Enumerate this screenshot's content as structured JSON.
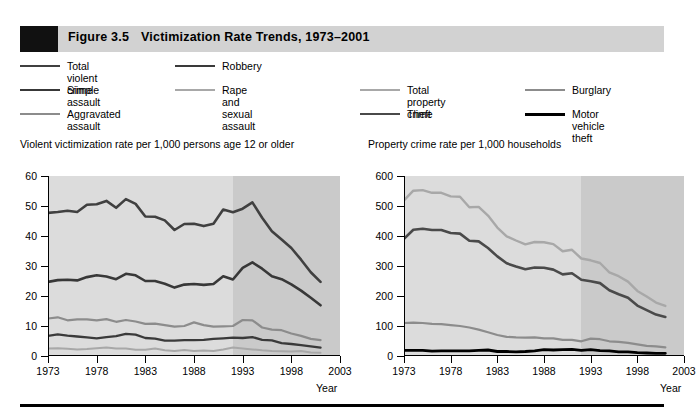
{
  "figure": {
    "number": "Figure 3.5",
    "title": "Victimization Rate Trends, 1973–2001"
  },
  "colors": {
    "total_violent_crime": "#404040",
    "robbery": "#3a3a3a",
    "simple_assault": "#383838",
    "rape_and_sexual_assault": "#a8a8a8",
    "aggravated_assault": "#8c8c8c",
    "total_property_crime": "#a8a8a8",
    "burglary": "#8c8c8c",
    "theft": "#4a4a4a",
    "motor_vehicle_theft": "#000000",
    "plot_background": "#dcdcdc",
    "shaded_region": "#cacaca",
    "title_bar": "#d2d2d2",
    "title_square": "#111111"
  },
  "legend": {
    "items": [
      {
        "label": "Total violent crime",
        "key": "total_violent_crime"
      },
      {
        "label": "Robbery",
        "key": "robbery"
      },
      {
        "label": "Simple assault",
        "key": "simple_assault"
      },
      {
        "label": "Rape and sexual\nassault",
        "key": "rape_and_sexual_assault"
      },
      {
        "label": "Aggravated assault",
        "key": "aggravated_assault"
      },
      {
        "label": "Total property crime",
        "key": "total_property_crime"
      },
      {
        "label": "Burglary",
        "key": "burglary"
      },
      {
        "label": "Theft",
        "key": "theft"
      },
      {
        "label": "Motor vehicle\ntheft",
        "key": "motor_vehicle_theft"
      }
    ]
  },
  "chart_data": [
    {
      "type": "line",
      "panel": "left",
      "title": "Violent victimization rate per 1,000 persons age 12 or older",
      "xlabel": "Year",
      "ylabel": "",
      "xlim": [
        1973,
        2003
      ],
      "ylim": [
        0,
        60
      ],
      "yticks": [
        0,
        10,
        20,
        30,
        40,
        50,
        60
      ],
      "xticks": [
        1973,
        1978,
        1983,
        1988,
        1993,
        1998,
        2003
      ],
      "grid": false,
      "legend_position": "top",
      "shaded_region": [
        1992,
        2003
      ],
      "x": [
        1973,
        1974,
        1975,
        1976,
        1977,
        1978,
        1979,
        1980,
        1981,
        1982,
        1983,
        1984,
        1985,
        1986,
        1987,
        1988,
        1989,
        1990,
        1991,
        1992,
        1993,
        1994,
        1995,
        1996,
        1997,
        1998,
        1999,
        2000,
        2001
      ],
      "series": [
        {
          "name": "Total violent crime",
          "values": [
            47.7,
            48.0,
            48.4,
            48.0,
            50.4,
            50.6,
            51.7,
            49.4,
            52.3,
            50.7,
            46.5,
            46.4,
            45.2,
            42.0,
            44.0,
            44.1,
            43.3,
            44.1,
            48.8,
            47.9,
            49.1,
            51.2,
            46.1,
            41.6,
            38.8,
            36.0,
            32.1,
            27.9,
            24.7
          ]
        },
        {
          "name": "Simple assault",
          "values": [
            24.7,
            25.3,
            25.4,
            25.2,
            26.3,
            26.9,
            26.5,
            25.6,
            27.4,
            26.9,
            25.0,
            25.0,
            24.1,
            22.8,
            23.8,
            24.0,
            23.7,
            24.0,
            26.6,
            25.5,
            29.4,
            31.2,
            29.1,
            26.6,
            25.6,
            23.9,
            21.8,
            19.4,
            16.9
          ]
        },
        {
          "name": "Aggravated assault",
          "values": [
            12.5,
            12.9,
            11.9,
            12.2,
            12.2,
            11.9,
            12.3,
            11.4,
            12.0,
            11.5,
            10.7,
            10.8,
            10.3,
            9.8,
            10.0,
            11.2,
            10.3,
            9.8,
            9.9,
            10.0,
            12.0,
            11.9,
            9.5,
            8.8,
            8.6,
            7.5,
            6.7,
            5.7,
            5.3
          ]
        },
        {
          "name": "Robbery",
          "values": [
            6.7,
            7.2,
            6.8,
            6.5,
            6.2,
            5.9,
            6.3,
            6.6,
            7.4,
            7.1,
            6.0,
            5.8,
            5.1,
            5.1,
            5.3,
            5.3,
            5.4,
            5.7,
            5.9,
            6.1,
            6.0,
            6.3,
            5.4,
            5.2,
            4.3,
            4.0,
            3.6,
            3.2,
            2.8
          ]
        },
        {
          "name": "Rape and sexual assault",
          "values": [
            2.5,
            2.6,
            2.4,
            2.2,
            2.3,
            2.6,
            2.8,
            2.5,
            2.5,
            2.1,
            2.1,
            2.5,
            1.9,
            1.7,
            2.0,
            1.7,
            1.8,
            1.7,
            2.2,
            2.8,
            2.5,
            2.2,
            1.9,
            1.7,
            1.6,
            1.5,
            1.7,
            1.2,
            1.1
          ]
        }
      ]
    },
    {
      "type": "line",
      "panel": "right",
      "title": "Property crime rate per 1,000 households",
      "xlabel": "Year",
      "ylabel": "",
      "xlim": [
        1973,
        2003
      ],
      "ylim": [
        0,
        600
      ],
      "yticks": [
        0,
        100,
        200,
        300,
        400,
        500,
        600
      ],
      "xticks": [
        1973,
        1978,
        1983,
        1988,
        1993,
        1998,
        2003
      ],
      "grid": false,
      "legend_position": "top",
      "shaded_region": [
        1992,
        2003
      ],
      "x": [
        1973,
        1974,
        1975,
        1976,
        1977,
        1978,
        1979,
        1980,
        1981,
        1982,
        1983,
        1984,
        1985,
        1986,
        1987,
        1988,
        1989,
        1990,
        1991,
        1992,
        1993,
        1994,
        1995,
        1996,
        1997,
        1998,
        1999,
        2000,
        2001
      ],
      "series": [
        {
          "name": "Total property crime",
          "values": [
            519,
            551,
            553,
            544,
            544,
            532,
            531,
            496,
            497,
            468,
            428,
            399,
            385,
            372,
            380,
            379,
            373,
            349,
            354,
            325,
            319,
            310,
            279,
            266,
            248,
            217,
            198,
            178,
            167
          ]
        },
        {
          "name": "Theft",
          "values": [
            391,
            421,
            424,
            420,
            420,
            410,
            408,
            384,
            382,
            360,
            332,
            309,
            298,
            289,
            295,
            294,
            288,
            272,
            276,
            254,
            249,
            243,
            219,
            206,
            194,
            168,
            153,
            138,
            130
          ]
        },
        {
          "name": "Burglary",
          "values": [
            110,
            111,
            110,
            107,
            106,
            103,
            100,
            95,
            88,
            79,
            70,
            64,
            62,
            61,
            62,
            59,
            59,
            54,
            54,
            49,
            58,
            56,
            49,
            47,
            44,
            39,
            34,
            32,
            29
          ]
        },
        {
          "name": "Motor vehicle theft",
          "values": [
            19,
            19,
            19,
            16,
            17,
            17,
            17,
            17,
            19,
            20,
            15,
            15,
            14,
            15,
            17,
            21,
            20,
            21,
            22,
            19,
            21,
            18,
            17,
            14,
            14,
            11,
            10,
            9,
            9
          ]
        }
      ]
    }
  ]
}
